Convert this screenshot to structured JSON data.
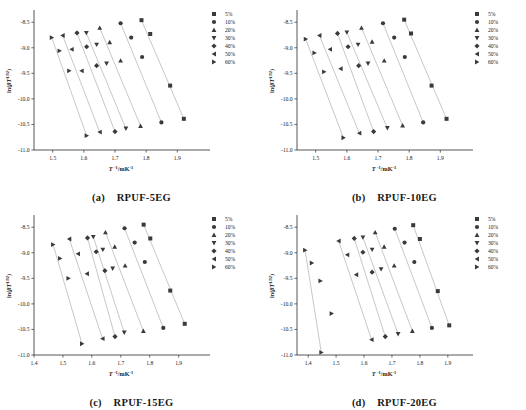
{
  "figure": {
    "axis_color": "#2b2b2b",
    "marker_color": "#3a3a3a",
    "line_color": "#b9b9b9",
    "background": "#ffffff"
  },
  "legend": {
    "entries": [
      {
        "label": "5%",
        "marker": "square"
      },
      {
        "label": "10%",
        "marker": "circle"
      },
      {
        "label": "20%",
        "marker": "triangle-up"
      },
      {
        "label": "30%",
        "marker": "triangle-down"
      },
      {
        "label": "40%",
        "marker": "diamond"
      },
      {
        "label": "50%",
        "marker": "triangle-left"
      },
      {
        "label": "60%",
        "marker": "triangle-right"
      }
    ]
  },
  "panels": [
    {
      "key": "a",
      "caption_label": "(a)",
      "caption_name": "RPUF-5EG",
      "xlabel": "T ⁻¹/mK⁻¹",
      "ylabel": "ln(βT ¹˙⁹²)"
    },
    {
      "key": "b",
      "caption_label": "(b)",
      "caption_name": "RPUF-10EG",
      "xlabel": "T ⁻¹/mK⁻¹",
      "ylabel": "ln(βT ¹˙⁹²)"
    },
    {
      "key": "c",
      "caption_label": "(c)",
      "caption_name": "RPUF-15EG",
      "xlabel": "T ⁻¹/mK⁻¹",
      "ylabel": "ln(βT ¹˙⁹²)"
    },
    {
      "key": "d",
      "caption_label": "(d)",
      "caption_name": "RPUF-20EG",
      "xlabel": "T ⁻¹/mK⁻¹",
      "ylabel": "ln(βT ¹˙⁹²)"
    }
  ],
  "chart_data": [
    {
      "type": "scatter",
      "panel": "a",
      "title": "(a) RPUF-5EG",
      "xlabel": "T -1/mK-1",
      "ylabel": "ln(BT^1.92)",
      "xlim": [
        1.44,
        1.96
      ],
      "ylim": [
        -11.0,
        -8.3
      ],
      "xticks": [
        1.5,
        1.6,
        1.7,
        1.8,
        1.9
      ],
      "yticks": [
        -8.5,
        -9.0,
        -9.5,
        -10.0,
        -10.5,
        -11.0
      ],
      "grid": false,
      "legend_position": "top-right-outside",
      "series": [
        {
          "name": "5%",
          "marker": "square",
          "x": [
            1.785,
            1.813,
            1.877,
            1.921
          ],
          "y": [
            -8.46,
            -8.73,
            -9.74,
            -10.39
          ]
        },
        {
          "name": "10%",
          "marker": "circle",
          "x": [
            1.718,
            1.752,
            1.787,
            1.849
          ],
          "y": [
            -8.52,
            -8.8,
            -9.18,
            -10.46
          ]
        },
        {
          "name": "20%",
          "marker": "triangle-up",
          "x": [
            1.651,
            1.683,
            1.718,
            1.782
          ],
          "y": [
            -8.61,
            -8.89,
            -9.25,
            -10.53
          ]
        },
        {
          "name": "30%",
          "marker": "triangle-down",
          "x": [
            1.608,
            1.641,
            1.673,
            1.735
          ],
          "y": [
            -8.71,
            -8.94,
            -9.31,
            -10.58
          ]
        },
        {
          "name": "40%",
          "marker": "diamond",
          "x": [
            1.578,
            1.609,
            1.641,
            1.7
          ],
          "y": [
            -8.71,
            -8.98,
            -9.35,
            -10.64
          ]
        },
        {
          "name": "50%",
          "marker": "triangle-left",
          "x": [
            1.532,
            1.561,
            1.593,
            1.651
          ],
          "y": [
            -8.76,
            -9.03,
            -9.45,
            -10.65
          ]
        },
        {
          "name": "60%",
          "marker": "triangle-right",
          "x": [
            1.497,
            1.522,
            1.553,
            1.609
          ],
          "y": [
            -8.8,
            -9.06,
            -9.45,
            -10.72
          ]
        }
      ]
    },
    {
      "type": "scatter",
      "panel": "b",
      "title": "(b) RPUF-10EG",
      "xlabel": "T -1/mK-1",
      "ylabel": "ln(BT^1.92)",
      "xlim": [
        1.44,
        1.96
      ],
      "ylim": [
        -11.0,
        -8.3
      ],
      "xticks": [
        1.5,
        1.6,
        1.7,
        1.8,
        1.9
      ],
      "yticks": [
        -8.5,
        -9.0,
        -9.5,
        -10.0,
        -10.5,
        -11.0
      ],
      "grid": false,
      "legend_position": "top-right-outside",
      "series": [
        {
          "name": "5%",
          "marker": "square",
          "x": [
            1.784,
            1.806,
            1.872,
            1.92
          ],
          "y": [
            -8.45,
            -8.72,
            -9.74,
            -10.39
          ]
        },
        {
          "name": "10%",
          "marker": "circle",
          "x": [
            1.716,
            1.752,
            1.786,
            1.845
          ],
          "y": [
            -8.52,
            -8.8,
            -9.18,
            -10.46
          ]
        },
        {
          "name": "20%",
          "marker": "triangle-up",
          "x": [
            1.647,
            1.681,
            1.72,
            1.779
          ],
          "y": [
            -8.61,
            -8.88,
            -9.25,
            -10.52
          ]
        },
        {
          "name": "30%",
          "marker": "triangle-down",
          "x": [
            1.6,
            1.636,
            1.668,
            1.73
          ],
          "y": [
            -8.7,
            -8.94,
            -9.31,
            -10.57
          ]
        },
        {
          "name": "40%",
          "marker": "diamond",
          "x": [
            1.57,
            1.604,
            1.638,
            1.686
          ],
          "y": [
            -8.72,
            -8.98,
            -9.35,
            -10.64
          ]
        },
        {
          "name": "50%",
          "marker": "triangle-left",
          "x": [
            1.512,
            1.546,
            1.58,
            1.64
          ],
          "y": [
            -8.76,
            -9.03,
            -9.41,
            -10.67
          ]
        },
        {
          "name": "60%",
          "marker": "triangle-right",
          "x": [
            1.468,
            1.496,
            1.527,
            1.589
          ],
          "y": [
            -8.83,
            -9.1,
            -9.47,
            -10.76
          ]
        }
      ]
    },
    {
      "type": "scatter",
      "panel": "c",
      "title": "(c) RPUF-15EG",
      "xlabel": "T -1/mK-1",
      "ylabel": "ln(BT^1.92)",
      "xlim": [
        1.4,
        1.96
      ],
      "ylim": [
        -11.0,
        -8.3
      ],
      "xticks": [
        1.4,
        1.5,
        1.6,
        1.7,
        1.8,
        1.9
      ],
      "yticks": [
        -8.5,
        -9.0,
        -9.5,
        -10.0,
        -10.5,
        -11.0
      ],
      "grid": false,
      "legend_position": "top-right-outside",
      "series": [
        {
          "name": "5%",
          "marker": "square",
          "x": [
            1.779,
            1.802,
            1.871,
            1.921
          ],
          "y": [
            -8.45,
            -8.72,
            -9.74,
            -10.39
          ]
        },
        {
          "name": "10%",
          "marker": "circle",
          "x": [
            1.713,
            1.748,
            1.783,
            1.847
          ],
          "y": [
            -8.52,
            -8.8,
            -9.18,
            -10.47
          ]
        },
        {
          "name": "20%",
          "marker": "triangle-up",
          "x": [
            1.647,
            1.679,
            1.715,
            1.778
          ],
          "y": [
            -8.6,
            -8.88,
            -9.25,
            -10.53
          ]
        },
        {
          "name": "30%",
          "marker": "triangle-down",
          "x": [
            1.605,
            1.638,
            1.672,
            1.712
          ],
          "y": [
            -8.69,
            -8.94,
            -9.31,
            -10.56
          ]
        },
        {
          "name": "40%",
          "marker": "diamond",
          "x": [
            1.585,
            1.615,
            1.645,
            1.68
          ],
          "y": [
            -8.71,
            -8.98,
            -9.35,
            -10.64
          ]
        },
        {
          "name": "50%",
          "marker": "triangle-left",
          "x": [
            1.522,
            1.552,
            1.583,
            1.637
          ],
          "y": [
            -8.73,
            -9.02,
            -9.41,
            -10.68
          ]
        },
        {
          "name": "60%",
          "marker": "triangle-right",
          "x": [
            1.466,
            1.49,
            1.519,
            1.566
          ],
          "y": [
            -8.84,
            -9.11,
            -9.5,
            -10.78
          ]
        }
      ]
    },
    {
      "type": "scatter",
      "panel": "d",
      "title": "(d) RPUF-20EG",
      "xlabel": "T -1/mK-1",
      "ylabel": "ln(BT^1.92)",
      "xlim": [
        1.36,
        1.94
      ],
      "ylim": [
        -11.0,
        -8.3
      ],
      "xticks": [
        1.4,
        1.5,
        1.6,
        1.7,
        1.8,
        1.9
      ],
      "yticks": [
        -8.5,
        -9.0,
        -9.5,
        -10.0,
        -10.5,
        -11.0
      ],
      "grid": false,
      "legend_position": "top-right-outside",
      "series": [
        {
          "name": "5%",
          "marker": "square",
          "x": [
            1.776,
            1.8,
            1.864,
            1.905
          ],
          "y": [
            -8.46,
            -8.73,
            -9.75,
            -10.42
          ]
        },
        {
          "name": "10%",
          "marker": "circle",
          "x": [
            1.71,
            1.745,
            1.78,
            1.843
          ],
          "y": [
            -8.53,
            -8.8,
            -9.18,
            -10.47
          ]
        },
        {
          "name": "20%",
          "marker": "triangle-up",
          "x": [
            1.64,
            1.672,
            1.708,
            1.773
          ],
          "y": [
            -8.6,
            -8.88,
            -9.25,
            -10.53
          ]
        },
        {
          "name": "30%",
          "marker": "triangle-down",
          "x": [
            1.596,
            1.629,
            1.661,
            1.722
          ],
          "y": [
            -8.7,
            -8.94,
            -9.32,
            -10.59
          ]
        },
        {
          "name": "40%",
          "marker": "diamond",
          "x": [
            1.565,
            1.596,
            1.629,
            1.676
          ],
          "y": [
            -8.72,
            -8.99,
            -9.38,
            -10.64
          ]
        },
        {
          "name": "50%",
          "marker": "triangle-left",
          "x": [
            1.509,
            1.54,
            1.572,
            1.627
          ],
          "y": [
            -8.77,
            -9.04,
            -9.43,
            -10.7
          ]
        },
        {
          "name": "60%",
          "marker": "triangle-right",
          "x": [
            1.389,
            1.413,
            1.444,
            1.484,
            1.447
          ],
          "y": [
            -8.95,
            -9.2,
            -9.55,
            -10.19,
            -10.95
          ]
        }
      ]
    }
  ]
}
